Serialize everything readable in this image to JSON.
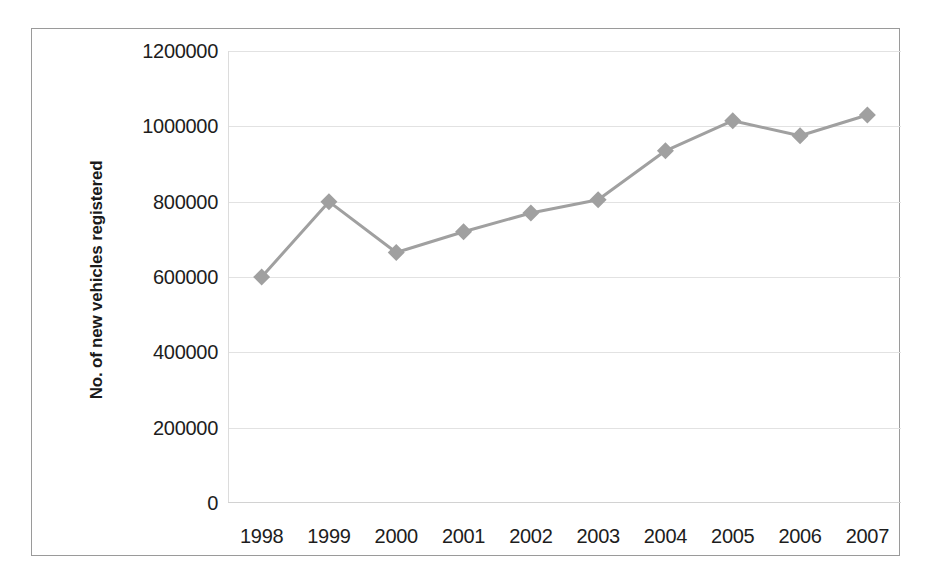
{
  "chart_data": {
    "type": "line",
    "title": "",
    "subtitle": "",
    "xlabel": "",
    "ylabel": "No. of new vehicles registered",
    "categories": [
      "1998",
      "1999",
      "2000",
      "2001",
      "2002",
      "2003",
      "2004",
      "2005",
      "2006",
      "2007"
    ],
    "values": [
      600000,
      800000,
      665000,
      720000,
      770000,
      805000,
      935000,
      1015000,
      975000,
      1030000
    ],
    "series": [
      {
        "name": "No. of new vehicles registered",
        "values": [
          600000,
          800000,
          665000,
          720000,
          770000,
          805000,
          935000,
          1015000,
          975000,
          1030000
        ]
      }
    ],
    "ylim": [
      0,
      1200000
    ],
    "y_ticks": [
      0,
      200000,
      400000,
      600000,
      800000,
      1000000,
      1200000
    ],
    "y_tick_labels": [
      "0",
      "200000",
      "400000",
      "600000",
      "800000",
      "1000000",
      "1200000"
    ],
    "grid": true,
    "grid_axis": "y",
    "legend": false,
    "legend_position": "none",
    "marker": "diamond",
    "series_color": "#a0a0a0",
    "gridline_color": "#e2e2e2",
    "text_color": "#1d1d1d",
    "frame_color": "#9a9a9a",
    "background": "#ffffff"
  }
}
